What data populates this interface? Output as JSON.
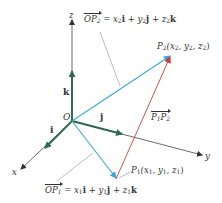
{
  "diagram": {
    "type": "3d-vector-diagram",
    "axes": {
      "x": {
        "label": "x"
      },
      "y": {
        "label": "y"
      },
      "z": {
        "label": "z"
      }
    },
    "origin": {
      "label": "O"
    },
    "unit_vectors": {
      "i": {
        "label": "i"
      },
      "j": {
        "label": "j"
      },
      "k": {
        "label": "k"
      }
    },
    "points": {
      "P1": {
        "name": "P",
        "sub": "1",
        "coords": "(x",
        "c1sub": "1",
        "c2": ", y",
        "c2sub": "1",
        "c3": ", z",
        "c3sub": "1",
        "close": ")"
      },
      "P2": {
        "name": "P",
        "sub": "2",
        "coords": "(x",
        "c1sub": "2",
        "c2": ", y",
        "c2sub": "2",
        "c3": ", z",
        "c3sub": "2",
        "close": ")"
      }
    },
    "vectors": {
      "OP2": {
        "name": "OP",
        "name_sub": "2",
        "eq": "=",
        "t1": "x",
        "t1sub": "2",
        "u1": "i",
        "plus1": "+",
        "t2": "y",
        "t2sub": "2",
        "u2": "j",
        "plus2": "+",
        "t3": "z",
        "t3sub": "2",
        "u3": "k"
      },
      "OP1": {
        "name": "OP",
        "name_sub": "1",
        "eq": "=",
        "t1": "x",
        "t1sub": "1",
        "u1": "i",
        "plus1": "+",
        "t2": "y",
        "t2sub": "1",
        "u2": "j",
        "plus2": "+",
        "t3": "z",
        "t3sub": "1",
        "u3": "k"
      },
      "P1P2": {
        "a": "P",
        "asub": "1",
        "b": "P",
        "bsub": "2"
      }
    },
    "colors": {
      "axis": "#333333",
      "unit_vector": "#2e6b4f",
      "position_vector": "#3ba7d6",
      "difference_vector": "#d23a3a",
      "leader": "#666666"
    }
  }
}
